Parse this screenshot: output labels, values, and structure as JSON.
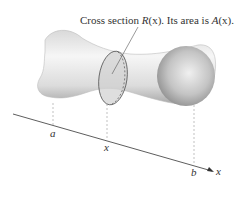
{
  "caption": {
    "prefix": "Cross section ",
    "R": "R",
    "x1": "(x)",
    "middle": ". Its area is ",
    "A": "A",
    "x2": "(x)",
    "suffix": "."
  },
  "axis": {
    "a_label": "a",
    "x_label": "x",
    "b_label": "b",
    "axis_label": "x"
  },
  "colors": {
    "solid_light": "#f2f2f2",
    "solid_shadow": "#9a9a9a",
    "cross_section": "#cfcfcf",
    "line": "#444444"
  }
}
